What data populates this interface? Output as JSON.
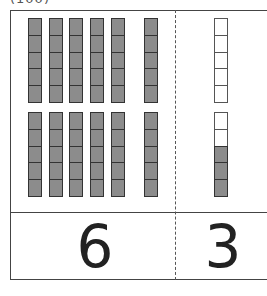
{
  "header": {
    "cropped_label": "(100)"
  },
  "place_value": {
    "tens": {
      "count": 6,
      "rods_x": [
        28,
        49,
        69,
        90,
        111,
        144
      ],
      "cells_per_rod": 10,
      "fill_color": "#8c8c8c"
    },
    "ones": {
      "rod_x": 214,
      "cells": [
        "empty",
        "empty",
        "empty",
        "empty",
        "empty",
        "empty",
        "empty",
        "filled",
        "filled",
        "filled"
      ],
      "filled_count": 3
    }
  },
  "answer": {
    "tens_digit": "6",
    "ones_digit": "3"
  }
}
